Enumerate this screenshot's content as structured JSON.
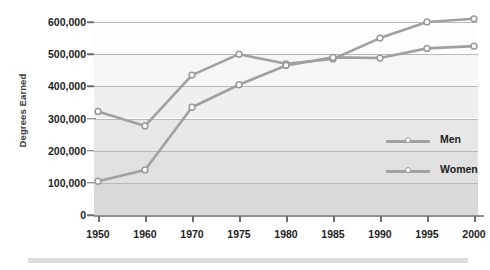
{
  "chart_data": {
    "type": "line",
    "title": "",
    "xlabel": "",
    "ylabel": "Degrees Earned",
    "categories": [
      "1950",
      "1960",
      "1970",
      "1975",
      "1980",
      "1985",
      "1990",
      "1995",
      "2000"
    ],
    "x_tick_labels": [
      "1950",
      "1960",
      "1970",
      "1975",
      "1980",
      "1985",
      "1990",
      "1995",
      "2000"
    ],
    "x_note": "(proj.)",
    "y_tick_labels": [
      "600,000",
      "500,000",
      "400,000",
      "300,000",
      "200,000",
      "100,000",
      "0"
    ],
    "y_tick_values": [
      600000,
      500000,
      400000,
      300000,
      200000,
      100000,
      0
    ],
    "ylim": [
      0,
      620000
    ],
    "grid": true,
    "legend_position": "right",
    "series": [
      {
        "name": "Men",
        "values": [
          322000,
          277000,
          435000,
          500000,
          470000,
          485000,
          550000,
          600000,
          610000
        ]
      },
      {
        "name": "Women",
        "values": [
          105000,
          140000,
          335000,
          405000,
          465000,
          490000,
          488000,
          518000,
          525000
        ]
      }
    ],
    "colors": {
      "line": "#a0a0a0",
      "marker_fill": "#ffffff",
      "marker_stroke": "#9a9a9a",
      "gridline": "#b8b8b8",
      "axis": "#8f8f8f",
      "text": "#1d1d1d",
      "band_top": "#fdfdfd",
      "band_bottom": "#d9d9d9"
    }
  },
  "legend": {
    "items": [
      {
        "label": "Men"
      },
      {
        "label": "Women"
      }
    ]
  }
}
